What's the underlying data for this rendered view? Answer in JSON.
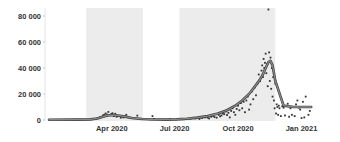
{
  "chart_data": {
    "type": "scatter",
    "title": "",
    "xlabel": "",
    "ylabel": "",
    "x_axis": {
      "type": "date",
      "start": "2020-01-01",
      "end": "2021-01-20",
      "ticks": [
        {
          "date": "2020-04-01",
          "label": "Apr 2020"
        },
        {
          "date": "2020-07-01",
          "label": "Jul 2020"
        },
        {
          "date": "2020-10-01",
          "label": "Oct 2020"
        },
        {
          "date": "2021-01-01",
          "label": "Jan 2021"
        }
      ]
    },
    "y_axis": {
      "ylim": [
        0,
        85000
      ],
      "ticks": [
        {
          "value": 0,
          "label": "0"
        },
        {
          "value": 20000,
          "label": "20 000"
        },
        {
          "value": 40000,
          "label": "40 000"
        },
        {
          "value": 60000,
          "label": "60 000"
        },
        {
          "value": 80000,
          "label": "80 000"
        }
      ]
    },
    "grid": false,
    "legend": "none",
    "shaded_periods": [
      {
        "start_day": 54,
        "end_day": 136
      },
      {
        "start_day": 189,
        "end_day": 328
      }
    ],
    "colors": {
      "shade": "#ececec",
      "trend": "#8a8a8a",
      "trend_outline": "#3c3c3c",
      "points": "#333333",
      "axis_text": "#333333"
    },
    "series": [
      {
        "name": "trend",
        "kind": "line",
        "day": [
          0,
          40,
          60,
          70,
          78,
          85,
          92,
          100,
          110,
          120,
          135,
          150,
          170,
          185,
          200,
          215,
          230,
          245,
          258,
          270,
          280,
          290,
          298,
          305,
          310,
          314,
          318,
          321,
          324,
          328,
          340,
          355,
          370,
          380
        ],
        "value": [
          200,
          300,
          500,
          1200,
          2500,
          3500,
          3800,
          3500,
          2600,
          1600,
          800,
          400,
          300,
          500,
          1000,
          1800,
          3000,
          5000,
          7500,
          11000,
          15000,
          20000,
          25500,
          30500,
          35000,
          40000,
          44500,
          45500,
          42000,
          30000,
          11000,
          10000,
          10000,
          10000
        ]
      },
      {
        "name": "daily",
        "kind": "scatter",
        "day": [
          70,
          74,
          78,
          80,
          82,
          84,
          86,
          88,
          90,
          92,
          94,
          96,
          98,
          100,
          104,
          108,
          112,
          118,
          128,
          150,
          152,
          175,
          195,
          205,
          212,
          218,
          222,
          226,
          230,
          232,
          235,
          238,
          240,
          243,
          246,
          248,
          250,
          252,
          254,
          256,
          258,
          260,
          262,
          264,
          266,
          268,
          270,
          272,
          274,
          276,
          278,
          280,
          282,
          284,
          286,
          288,
          290,
          292,
          294,
          296,
          298,
          300,
          302,
          304,
          306,
          308,
          309,
          310,
          311,
          312,
          313,
          314,
          315,
          316,
          317,
          318,
          319,
          320,
          321,
          322,
          323,
          324,
          325,
          326,
          327,
          328,
          329,
          330,
          331,
          332,
          333,
          334,
          336,
          338,
          340,
          342,
          344,
          346,
          348,
          350,
          352,
          354,
          356,
          358,
          360,
          362,
          364,
          366,
          368,
          370,
          372,
          374,
          376,
          378
        ],
        "value": [
          1500,
          2200,
          3500,
          4000,
          5000,
          4200,
          6200,
          3800,
          4500,
          5200,
          3000,
          4800,
          2500,
          3200,
          1800,
          2000,
          4000,
          1500,
          3400,
          3000,
          800,
          600,
          600,
          1000,
          1200,
          800,
          1500,
          2000,
          1800,
          1200,
          2500,
          3000,
          2200,
          1800,
          4000,
          2800,
          3500,
          5000,
          4500,
          6500,
          3800,
          5500,
          2000,
          7000,
          9000,
          6000,
          4000,
          8500,
          11000,
          7500,
          13000,
          9000,
          14000,
          6000,
          15000,
          18000,
          8000,
          12000,
          22000,
          16000,
          25000,
          19000,
          28000,
          35000,
          30000,
          38000,
          42000,
          33000,
          47000,
          40000,
          44000,
          51000,
          36000,
          43000,
          26000,
          85000,
          52000,
          30000,
          48000,
          24000,
          40000,
          18000,
          33000,
          15000,
          9000,
          28000,
          5000,
          12000,
          10000,
          4000,
          11000,
          9000,
          3000,
          10500,
          9500,
          3500,
          11000,
          12500,
          2500,
          9000,
          4000,
          10000,
          3000,
          12000,
          15000,
          9500,
          8000,
          1500,
          14000,
          2000,
          18000,
          10000,
          4000,
          7000,
          3000
        ]
      }
    ]
  }
}
